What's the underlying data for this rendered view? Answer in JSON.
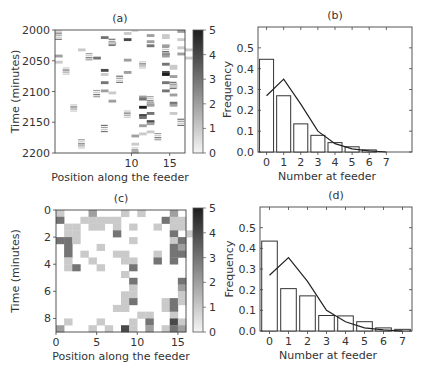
{
  "chart_data": [
    {
      "id": "a",
      "panel_label": "(a)",
      "type": "heatmap",
      "xlabel": "Position along the feeder",
      "ylabel": "Time (minutes)",
      "xticks": [
        10,
        15
      ],
      "yticks": [
        2000,
        2050,
        2100,
        2150,
        2200
      ],
      "xlim": [
        0,
        17
      ],
      "ylim": [
        2000,
        2200
      ],
      "colorbar": {
        "min": 0,
        "max": 5,
        "ticks": [
          0,
          1,
          2,
          3,
          4,
          5
        ]
      },
      "cells": [
        [
          1,
          6,
          3
        ],
        [
          1,
          9,
          4
        ],
        [
          1,
          12,
          2
        ],
        [
          2,
          7,
          2
        ],
        [
          2,
          12,
          3
        ],
        [
          3,
          16,
          2
        ],
        [
          4,
          0,
          2
        ],
        [
          4,
          5,
          3
        ],
        [
          4,
          9,
          2
        ],
        [
          5,
          0,
          1
        ],
        [
          0,
          9,
          1
        ],
        [
          0,
          12,
          2
        ],
        [
          3,
          3,
          1
        ],
        [
          6,
          6,
          4
        ],
        [
          6,
          9,
          2
        ],
        [
          7,
          6,
          1
        ],
        [
          8,
          6,
          3
        ],
        [
          9,
          6,
          2
        ],
        [
          10,
          7,
          1
        ],
        [
          11,
          7,
          2
        ],
        [
          0,
          14,
          1
        ],
        [
          1,
          14,
          1
        ],
        [
          2,
          14,
          2
        ],
        [
          3,
          14,
          3
        ],
        [
          4,
          14,
          2
        ],
        [
          5,
          14,
          3
        ],
        [
          6,
          14,
          4
        ],
        [
          7,
          14,
          5
        ],
        [
          8,
          14,
          3
        ],
        [
          9,
          14,
          3
        ],
        [
          0,
          16,
          2
        ],
        [
          1,
          16,
          1
        ],
        [
          2,
          16,
          1
        ],
        [
          3,
          17,
          1
        ],
        [
          4,
          17,
          1
        ],
        [
          5,
          15,
          1
        ],
        [
          6,
          15,
          1
        ],
        [
          7,
          15,
          2
        ],
        [
          8,
          15,
          1
        ],
        [
          9,
          15,
          1
        ],
        [
          10,
          15,
          2
        ],
        [
          11,
          15,
          3
        ],
        [
          12,
          15,
          2
        ],
        [
          13,
          15,
          1
        ],
        [
          11,
          12,
          1
        ],
        [
          12,
          12,
          2
        ],
        [
          13,
          12,
          3
        ],
        [
          14,
          12,
          4
        ],
        [
          15,
          12,
          2
        ],
        [
          16,
          12,
          1
        ],
        [
          10,
          11,
          2
        ],
        [
          11,
          11,
          3
        ],
        [
          12,
          11,
          5
        ],
        [
          13,
          11,
          4
        ],
        [
          14,
          11,
          3
        ],
        [
          15,
          11,
          2
        ],
        [
          16,
          11,
          1
        ],
        [
          17,
          10,
          2
        ],
        [
          18,
          10,
          1
        ],
        [
          19,
          10,
          1
        ]
      ]
    },
    {
      "id": "b",
      "panel_label": "(b)",
      "type": "bar",
      "xlabel": "Number at feeder",
      "ylabel": "Frequency",
      "categories": [
        "0",
        "1",
        "2",
        "3",
        "4",
        "5",
        "6",
        "7"
      ],
      "values": [
        0.445,
        0.27,
        0.135,
        0.08,
        0.045,
        0.025,
        0.01,
        0.0
      ],
      "line_series": {
        "name": "fit",
        "x": [
          0,
          1,
          2,
          3,
          4,
          5,
          6,
          7
        ],
        "values": [
          0.27,
          0.35,
          0.23,
          0.1,
          0.04,
          0.015,
          0.005,
          0.0
        ]
      },
      "yticks": [
        0.0,
        0.1,
        0.2,
        0.3,
        0.4,
        0.5
      ],
      "ylim": [
        0,
        0.6
      ],
      "xlim": [
        -0.5,
        8.5
      ]
    },
    {
      "id": "c",
      "panel_label": "(c)",
      "type": "heatmap",
      "xlabel": "Position along the feeder",
      "ylabel": "Time (minutes)",
      "xticks": [
        0,
        5,
        10,
        15
      ],
      "yticks": [
        0,
        2,
        4,
        6,
        8
      ],
      "xlim": [
        0,
        16
      ],
      "ylim": [
        0,
        9
      ],
      "colorbar": {
        "min": 0,
        "max": 5,
        "ticks": [
          0,
          1,
          2,
          3,
          4,
          5
        ]
      },
      "grid_rows": 18,
      "grid_cols": 16,
      "cells": [
        [
          0,
          0,
          1
        ],
        [
          0,
          4,
          2
        ],
        [
          0,
          8,
          1
        ],
        [
          0,
          10,
          1
        ],
        [
          0,
          14,
          2
        ],
        [
          1,
          0,
          3
        ],
        [
          1,
          3,
          1
        ],
        [
          1,
          4,
          1
        ],
        [
          1,
          5,
          1
        ],
        [
          1,
          6,
          1
        ],
        [
          1,
          7,
          1
        ],
        [
          1,
          13,
          3
        ],
        [
          1,
          14,
          1
        ],
        [
          1,
          15,
          1
        ],
        [
          2,
          1,
          1
        ],
        [
          2,
          2,
          1
        ],
        [
          2,
          4,
          1
        ],
        [
          2,
          5,
          1
        ],
        [
          2,
          7,
          1
        ],
        [
          2,
          9,
          1
        ],
        [
          2,
          12,
          1
        ],
        [
          2,
          14,
          1
        ],
        [
          2,
          15,
          1
        ],
        [
          3,
          1,
          1
        ],
        [
          3,
          2,
          1
        ],
        [
          3,
          7,
          3
        ],
        [
          3,
          14,
          3
        ],
        [
          3,
          16,
          1
        ],
        [
          4,
          0,
          3
        ],
        [
          4,
          1,
          3
        ],
        [
          4,
          2,
          1
        ],
        [
          4,
          9,
          1
        ],
        [
          4,
          14,
          1
        ],
        [
          4,
          15,
          3
        ],
        [
          5,
          1,
          3
        ],
        [
          5,
          5,
          1
        ],
        [
          5,
          14,
          3
        ],
        [
          5,
          15,
          2
        ],
        [
          6,
          1,
          3
        ],
        [
          6,
          3,
          1
        ],
        [
          6,
          7,
          1
        ],
        [
          6,
          8,
          1
        ],
        [
          6,
          12,
          1
        ],
        [
          6,
          14,
          3
        ],
        [
          6,
          15,
          3
        ],
        [
          7,
          1,
          1
        ],
        [
          7,
          4,
          1
        ],
        [
          7,
          8,
          1
        ],
        [
          7,
          9,
          1
        ],
        [
          7,
          12,
          3
        ],
        [
          7,
          14,
          3
        ],
        [
          8,
          1,
          1
        ],
        [
          8,
          2,
          3
        ],
        [
          8,
          5,
          1
        ],
        [
          8,
          9,
          3
        ],
        [
          9,
          8,
          1
        ],
        [
          10,
          9,
          3
        ],
        [
          10,
          15,
          3
        ],
        [
          11,
          9,
          1
        ],
        [
          11,
          15,
          2
        ],
        [
          12,
          8,
          1
        ],
        [
          12,
          9,
          1
        ],
        [
          12,
          15,
          1
        ],
        [
          13,
          8,
          1
        ],
        [
          13,
          9,
          3
        ],
        [
          13,
          13,
          1
        ],
        [
          13,
          14,
          3
        ],
        [
          13,
          15,
          1
        ],
        [
          14,
          7,
          1
        ],
        [
          14,
          8,
          1
        ],
        [
          14,
          13,
          1
        ],
        [
          14,
          14,
          3
        ],
        [
          15,
          10,
          1
        ],
        [
          15,
          11,
          1
        ],
        [
          15,
          14,
          1
        ],
        [
          16,
          1,
          1
        ],
        [
          16,
          5,
          1
        ],
        [
          16,
          9,
          1
        ],
        [
          16,
          11,
          3
        ],
        [
          16,
          14,
          4
        ],
        [
          16,
          15,
          1
        ],
        [
          17,
          0,
          2
        ],
        [
          17,
          4,
          1
        ],
        [
          17,
          6,
          1
        ],
        [
          17,
          8,
          4
        ],
        [
          17,
          9,
          1
        ],
        [
          17,
          11,
          2
        ],
        [
          17,
          13,
          1
        ],
        [
          17,
          14,
          3
        ],
        [
          17,
          15,
          2
        ]
      ]
    },
    {
      "id": "d",
      "panel_label": "(d)",
      "type": "bar",
      "xlabel": "Number at feeder",
      "ylabel": "Frequency",
      "categories": [
        "0",
        "1",
        "2",
        "3",
        "4",
        "5",
        "6",
        "7"
      ],
      "values": [
        0.435,
        0.205,
        0.17,
        0.075,
        0.073,
        0.045,
        0.015,
        0.008
      ],
      "line_series": {
        "name": "fit",
        "x": [
          0,
          1,
          2,
          3,
          4,
          5,
          6,
          7
        ],
        "values": [
          0.27,
          0.355,
          0.24,
          0.1,
          0.045,
          0.015,
          0.005,
          0.0
        ]
      },
      "yticks": [
        0.0,
        0.1,
        0.2,
        0.3,
        0.4,
        0.5
      ],
      "ylim": [
        0,
        0.6
      ],
      "xlim": [
        -0.5,
        7.5
      ]
    }
  ]
}
